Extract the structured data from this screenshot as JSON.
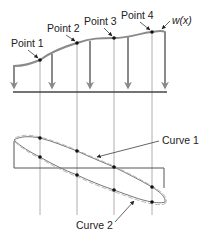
{
  "diagram": {
    "load_label": "w(x)",
    "points": [
      {
        "label": "Point 1",
        "x": 40,
        "y": 60
      },
      {
        "label": "Point 2",
        "x": 77,
        "y": 43
      },
      {
        "label": "Point 3",
        "x": 114,
        "y": 38
      },
      {
        "label": "Point 4",
        "x": 152,
        "y": 32
      }
    ],
    "curves": [
      {
        "label": "Curve 1"
      },
      {
        "label": "Curve 2"
      }
    ],
    "colors": {
      "load_curve": "#8a8a8a",
      "lines": "#555555",
      "guides": "#9a9a9a",
      "dots": "#111111"
    }
  }
}
